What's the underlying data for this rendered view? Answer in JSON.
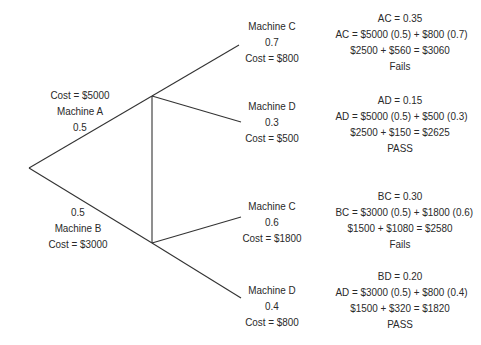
{
  "tree": {
    "first_stage": [
      {
        "machine": "Machine A",
        "cost": "Cost = $5000",
        "probability": "0.5"
      },
      {
        "machine": "Machine B",
        "cost": "Cost = $3000",
        "probability": "0.5"
      }
    ],
    "second_stage": [
      {
        "machine": "Machine C",
        "probability": "0.7",
        "cost": "Cost = $800"
      },
      {
        "machine": "Machine D",
        "probability": "0.3",
        "cost": "Cost = $500"
      },
      {
        "machine": "Machine C",
        "probability": "0.6",
        "cost": "Cost = $1800"
      },
      {
        "machine": "Machine D",
        "probability": "0.4",
        "cost": "Cost = $800"
      }
    ],
    "outcomes": [
      {
        "joint": "AC = 0.35",
        "formula": "AC = $5000 (0.5) + $800 (0.7)",
        "sum": "$2500 + $560 = $3060",
        "result": "Fails"
      },
      {
        "joint": "AD = 0.15",
        "formula": "AD = $5000 (0.5) + $500 (0.3)",
        "sum": "$2500 + $150 = $2625",
        "result": "PASS"
      },
      {
        "joint": "BC = 0.30",
        "formula": "BC = $3000 (0.5) + $1800 (0.6)",
        "sum": "$1500 + $1080 = $2580",
        "result": "Fails"
      },
      {
        "joint": "BD = 0.20",
        "formula": "AD = $3000 (0.5) + $800 (0.4)",
        "sum": "$1500 + $320 = $1820",
        "result": "PASS"
      }
    ]
  },
  "colors": {
    "line": "#333333",
    "text": "#2a2a2a",
    "background": "#ffffff"
  }
}
